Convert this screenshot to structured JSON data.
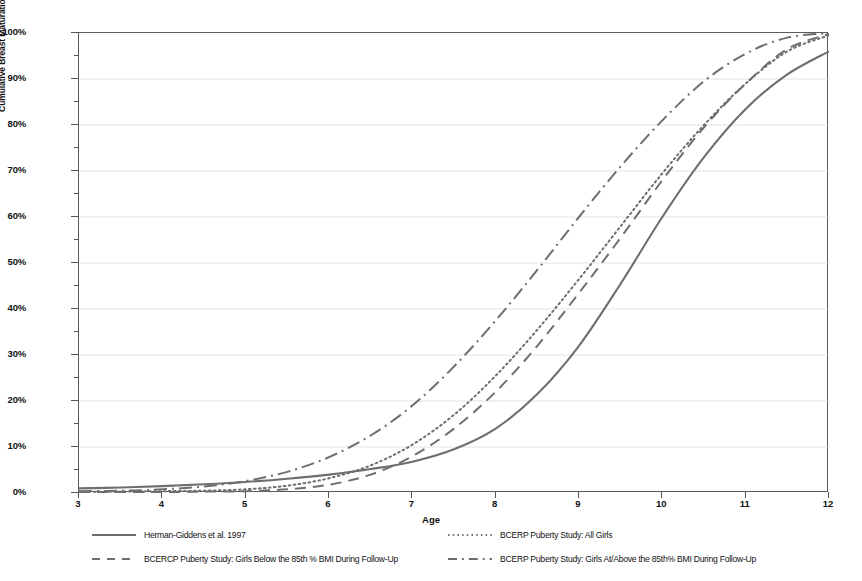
{
  "chart_data": {
    "type": "line",
    "title": "",
    "xlabel": "Age",
    "ylabel": "Cumulative Breast Maturation Prevalence",
    "xlim": [
      3,
      12
    ],
    "ylim": [
      0,
      1
    ],
    "grid": true,
    "grid_axis": "y",
    "legend_position": "below",
    "x_tick_labels": [
      "3",
      "4",
      "5",
      "6",
      "7",
      "8",
      "9",
      "10",
      "11",
      "12"
    ],
    "x_ticks": [
      3,
      4,
      5,
      6,
      7,
      8,
      9,
      10,
      11,
      12
    ],
    "y_tick_labels": [
      "0%",
      "10%",
      "20%",
      "30%",
      "40%",
      "50%",
      "60%",
      "70%",
      "80%",
      "90%",
      "100%"
    ],
    "y_ticks": [
      0,
      10,
      20,
      30,
      40,
      50,
      60,
      70,
      80,
      90,
      100
    ],
    "y_minor_ticks": [
      5,
      15,
      25,
      35,
      45,
      55,
      65,
      75,
      85,
      95
    ],
    "x": [
      3,
      3.5,
      4,
      4.5,
      5,
      5.5,
      6,
      6.5,
      7,
      7.5,
      8,
      8.5,
      9,
      9.5,
      10,
      10.5,
      11,
      11.5,
      12
    ],
    "series": [
      {
        "name": "Herman-Giddens et al. 1997",
        "style": "solid",
        "color": "#6e6e6e",
        "values": [
          1.0,
          1.2,
          1.5,
          1.9,
          2.4,
          3.1,
          4.0,
          5.2,
          6.8,
          9.5,
          14.0,
          21.5,
          32.0,
          45.5,
          60.0,
          73.0,
          83.5,
          91.0,
          96.0
        ]
      },
      {
        "name": "BCERP Puberty Study: All Girls",
        "style": "dotted",
        "color": "#6e6e6e",
        "values": [
          0.3,
          0.3,
          0.4,
          0.5,
          0.8,
          1.6,
          3.2,
          6.0,
          10.5,
          17.0,
          25.5,
          35.5,
          46.5,
          58.0,
          69.5,
          80.0,
          89.0,
          96.0,
          99.5
        ]
      },
      {
        "name": "BCERCP Puberty Study: Girls Below the 85th % BMI During Follow-Up",
        "style": "dashed",
        "color": "#6e6e6e",
        "values": [
          0.2,
          0.2,
          0.2,
          0.3,
          0.4,
          0.8,
          1.8,
          4.0,
          8.0,
          14.0,
          22.0,
          32.0,
          43.5,
          55.5,
          68.0,
          79.5,
          89.0,
          96.5,
          99.8
        ]
      },
      {
        "name": "BCERP Puberty Study: Girls At/Above the 85th% BMI During Follow-Up",
        "style": "dashdot",
        "color": "#6e6e6e",
        "values": [
          0.4,
          0.5,
          0.8,
          1.4,
          2.6,
          4.6,
          7.8,
          12.5,
          19.0,
          27.5,
          37.5,
          48.5,
          60.0,
          71.0,
          81.0,
          89.5,
          95.5,
          99.0,
          100.0
        ]
      }
    ]
  },
  "axes": {
    "x_title": "Age",
    "y_title": "Cumulative Breast Maturation Prevalence"
  },
  "legend": {
    "entries": [
      {
        "label": "Herman-Giddens et al. 1997",
        "style": "solid",
        "column": "left",
        "row": 1
      },
      {
        "label": "BCERCP Puberty Study: Girls Below the 85th % BMI During Follow-Up",
        "style": "dashed",
        "column": "left",
        "row": 2
      },
      {
        "label": "BCERP Puberty Study: All Girls",
        "style": "dotted",
        "column": "right",
        "row": 1
      },
      {
        "label": "BCERP Puberty Study: Girls At/Above the 85th% BMI During Follow-Up",
        "style": "dashdot",
        "column": "right",
        "row": 2
      }
    ]
  },
  "colors": {
    "line": "#6e6e6e",
    "axis": "#555555",
    "grid": "#dcdcdc",
    "text": "#111111",
    "background": "#ffffff"
  }
}
